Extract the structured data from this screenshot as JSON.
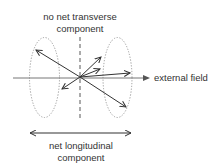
{
  "labels": {
    "top_line1": "no net transverse",
    "top_line2": "component",
    "field": "external field",
    "bottom_line1": "net longitudinal",
    "bottom_line2": "component"
  },
  "colors": {
    "vector": "#333333",
    "axis": "#666666",
    "ellipse": "#999999",
    "text": "#333333"
  }
}
